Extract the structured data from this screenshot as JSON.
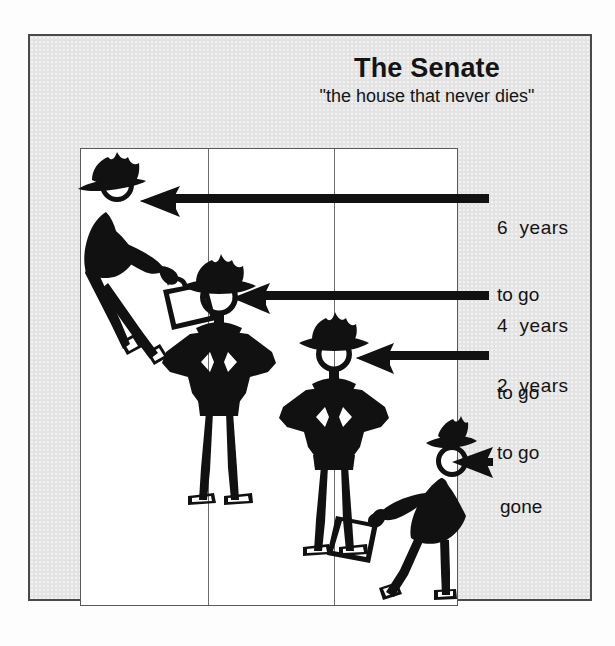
{
  "figure": {
    "title": "The Senate",
    "subtitle": "\"the house that never dies\"",
    "type": "diagram",
    "background_color": "#e4e4e4",
    "panel_color": "#ffffff",
    "ink_color": "#111111"
  },
  "grid": {
    "columns": 3,
    "divider_positions": [
      205,
      331
    ]
  },
  "callouts": [
    {
      "id": "six-years",
      "line1": "6  years",
      "line2": "to go",
      "arrow": {
        "from_x": 489,
        "to_x": 139,
        "y": 198,
        "style": "long-arrow-left"
      },
      "target_figure": "senator-one"
    },
    {
      "id": "four-years",
      "line1": "4  years",
      "line2": "to go",
      "arrow": {
        "from_x": 489,
        "to_x": 231,
        "y": 295,
        "style": "long-arrow-left"
      },
      "target_figure": "senator-two"
    },
    {
      "id": "two-years",
      "line1": "2  years",
      "line2": "to go",
      "arrow": {
        "from_x": 489,
        "to_x": 356,
        "y": 355,
        "style": "long-arrow-left"
      },
      "target_figure": "senator-three"
    },
    {
      "id": "gone",
      "line1": "gone",
      "line2": "",
      "arrow": {
        "from_x": 492,
        "to_x": 452,
        "y": 462,
        "style": "arrowhead-only"
      },
      "target_figure": "senator-four"
    }
  ],
  "figures": [
    {
      "id": "senator-one",
      "pose": "walking-with-briefcase-leaning",
      "hat": "cowboy-hat",
      "column": 1,
      "label": "6 years to go"
    },
    {
      "id": "senator-two",
      "pose": "standing-hands-on-hips",
      "hat": "cowboy-hat",
      "column": 2,
      "label": "4 years to go"
    },
    {
      "id": "senator-three",
      "pose": "standing-hands-on-hips",
      "hat": "cowboy-hat",
      "column": 3,
      "label": "2 years to go"
    },
    {
      "id": "senator-four",
      "pose": "walking-away-with-briefcase",
      "hat": "cowboy-hat",
      "column": 3,
      "label": "gone"
    }
  ]
}
